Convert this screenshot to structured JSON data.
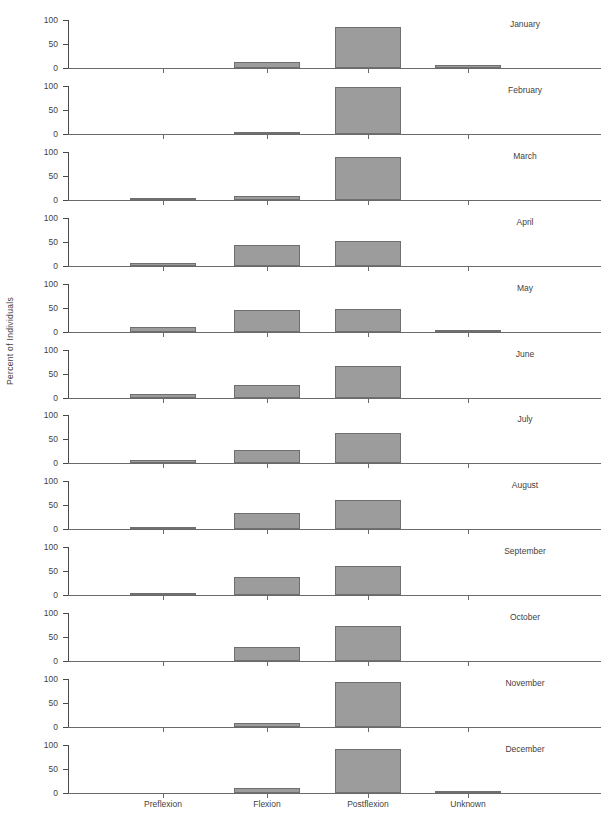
{
  "chart_data": {
    "type": "bar",
    "title": "",
    "subtitle": "",
    "xlabel": "",
    "ylabel": "Percent of Individuals",
    "ylim": [
      0,
      100
    ],
    "yticks": [
      0,
      50,
      100
    ],
    "ytick_labels": [
      "0",
      "50",
      "100"
    ],
    "grid": false,
    "legend": "none",
    "layout": "small-multiples, 12 stacked panels (one per month), shared x axis",
    "categories": [
      "Preflexion",
      "Flexion",
      "Postflexion",
      "Unknown"
    ],
    "panels": [
      {
        "label": "January",
        "values": [
          0,
          13,
          86,
          6
        ]
      },
      {
        "label": "February",
        "values": [
          0,
          4,
          98,
          0
        ]
      },
      {
        "label": "March",
        "values": [
          4,
          8,
          89,
          0
        ]
      },
      {
        "label": "April",
        "values": [
          5,
          43,
          52,
          0
        ]
      },
      {
        "label": "May",
        "values": [
          9,
          44,
          47,
          1
        ]
      },
      {
        "label": "June",
        "values": [
          8,
          27,
          65,
          0
        ]
      },
      {
        "label": "July",
        "values": [
          8,
          28,
          64,
          0
        ]
      },
      {
        "label": "August",
        "values": [
          4,
          35,
          61,
          0
        ]
      },
      {
        "label": "September",
        "values": [
          1,
          38,
          61,
          0
        ]
      },
      {
        "label": "October",
        "values": [
          0,
          29,
          73,
          0
        ]
      },
      {
        "label": "November",
        "values": [
          0,
          8,
          94,
          0
        ]
      },
      {
        "label": "December",
        "values": [
          0,
          10,
          91,
          2
        ]
      }
    ],
    "colors": {
      "bar_fill": "#9c9c9c",
      "bar_edge": "#6f6f6f",
      "axis": "#4a4a4a",
      "text": "#3f3f3f",
      "background": "#ffffff"
    }
  }
}
